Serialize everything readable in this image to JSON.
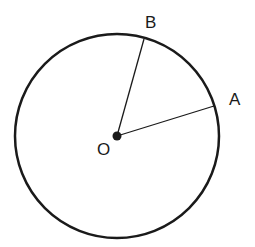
{
  "diagram": {
    "type": "circle-with-radii",
    "stroke_color": "#1a1a1a",
    "background": "#ffffff",
    "circle": {
      "cx": 117,
      "cy": 136,
      "r": 102,
      "stroke_width": 2.5
    },
    "center": {
      "label": "O",
      "x": 117,
      "y": 136,
      "dot_radius": 4.5
    },
    "points": [
      {
        "label": "A",
        "x": 214,
        "y": 106
      },
      {
        "label": "B",
        "x": 144,
        "y": 39
      }
    ],
    "segments": [
      {
        "from": "O",
        "to": "A"
      },
      {
        "from": "O",
        "to": "B"
      }
    ],
    "labels": {
      "O": "O",
      "A": "A",
      "B": "B"
    }
  }
}
